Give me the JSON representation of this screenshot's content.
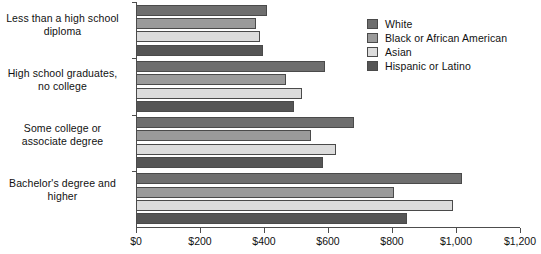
{
  "chart_data": {
    "type": "bar",
    "orientation": "horizontal",
    "title": "",
    "xlabel": "",
    "ylabel": "",
    "categories": [
      "Less than a high school diploma",
      "High school graduates, no college",
      "Some college or associate degree",
      "Bachelor's degree and higher"
    ],
    "category_lines": [
      [
        "Less than a high school",
        "diploma"
      ],
      [
        "High school graduates,",
        "no college"
      ],
      [
        "Some college or",
        "associate degree"
      ],
      [
        "Bachelor's degree and",
        "higher"
      ]
    ],
    "series": [
      {
        "name": "White",
        "color": "#6e6e6e",
        "values": [
          410,
          592,
          680,
          1019
        ]
      },
      {
        "name": "Black or African American",
        "color": "#9a9a9a",
        "values": [
          376,
          470,
          546,
          806
        ]
      },
      {
        "name": "Asian",
        "color": "#dcdcdc",
        "values": [
          389,
          520,
          624,
          991
        ]
      },
      {
        "name": "Hispanic or Latino",
        "color": "#555555",
        "values": [
          398,
          495,
          583,
          846
        ]
      }
    ],
    "xlim": [
      0,
      1200
    ],
    "xticks": [
      0,
      200,
      400,
      600,
      800,
      1000,
      1200
    ],
    "xticklabels": [
      "$0",
      "$200",
      "$400",
      "$600",
      "$800",
      "$1,000",
      "$1,200"
    ],
    "grid": false,
    "legend_position": "top-right",
    "legend_entries": [
      "White",
      "Black or African American",
      "Asian",
      "Hispanic or Latino"
    ]
  }
}
